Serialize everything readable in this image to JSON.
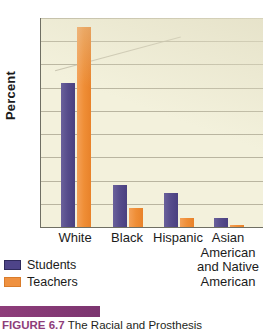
{
  "chart_data": {
    "type": "bar",
    "title": "",
    "xlabel": "",
    "ylabel": "Percent",
    "ylim": [
      0,
      90
    ],
    "yticks": [
      10,
      20,
      30,
      40,
      50,
      60,
      70,
      80,
      90
    ],
    "grid": true,
    "legend_position": "below-left",
    "categories": [
      "White",
      "Black",
      "Hispanic",
      "Asian American and Native American"
    ],
    "category_lines": [
      [
        "White"
      ],
      [
        "Black"
      ],
      [
        "Hispanic"
      ],
      [
        "Asian",
        "American",
        "and Native",
        "American"
      ]
    ],
    "series": [
      {
        "name": "Students",
        "color": "#4e4489",
        "values": [
          62,
          18,
          14.5,
          4
        ]
      },
      {
        "name": "Teachers",
        "color": "#ef9140",
        "values": [
          86,
          8,
          4,
          1
        ]
      }
    ]
  },
  "legend": {
    "items": [
      {
        "label": "Students",
        "color": "#4e4489"
      },
      {
        "label": "Teachers",
        "color": "#ef9140"
      }
    ]
  },
  "caption": {
    "figure_label": "FIGURE 6.7",
    "body": "The Racial and Prosthesis"
  },
  "colors": {
    "plot_background": "#f3f1dc",
    "gridline": "#b9b5a0",
    "axis": "#6f6f63",
    "students": "#4e4489",
    "teachers": "#ef9140",
    "caption_rule": "#8e3d7a"
  }
}
